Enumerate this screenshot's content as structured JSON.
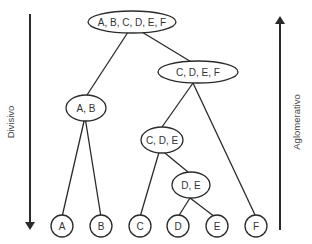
{
  "diagram": {
    "type": "hierarchical-clustering-dendrogram",
    "axes": {
      "left": {
        "label": "Divisivo",
        "direction": "down"
      },
      "right": {
        "label": "Aglomerativo",
        "direction": "up"
      }
    },
    "nodes": [
      {
        "id": "abcdef",
        "label": "A, B, C, D, E, F"
      },
      {
        "id": "cdef",
        "label": "C, D, E, F"
      },
      {
        "id": "ab",
        "label": "A, B"
      },
      {
        "id": "cde",
        "label": "C, D, E"
      },
      {
        "id": "de",
        "label": "D, E"
      },
      {
        "id": "a",
        "label": "A"
      },
      {
        "id": "b",
        "label": "B"
      },
      {
        "id": "c",
        "label": "C"
      },
      {
        "id": "d",
        "label": "D"
      },
      {
        "id": "e",
        "label": "E"
      },
      {
        "id": "f",
        "label": "F"
      }
    ],
    "edges": [
      [
        "abcdef",
        "ab"
      ],
      [
        "abcdef",
        "cdef"
      ],
      [
        "ab",
        "a"
      ],
      [
        "ab",
        "b"
      ],
      [
        "cdef",
        "cde"
      ],
      [
        "cdef",
        "f"
      ],
      [
        "cde",
        "c"
      ],
      [
        "cde",
        "de"
      ],
      [
        "de",
        "d"
      ],
      [
        "de",
        "e"
      ]
    ]
  }
}
